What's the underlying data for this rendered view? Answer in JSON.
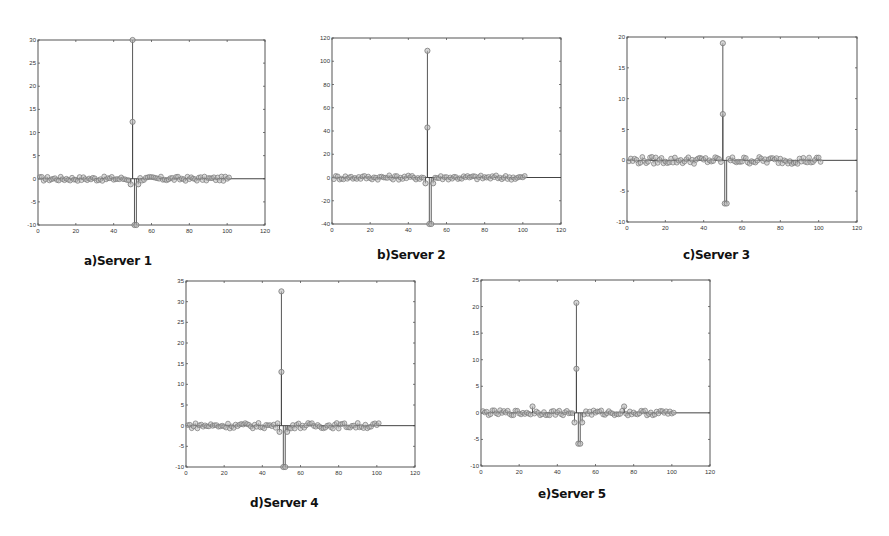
{
  "figure": {
    "panels": [
      {
        "id": "a",
        "caption": "a)Server 1"
      },
      {
        "id": "b",
        "caption": "b)Server 2"
      },
      {
        "id": "c",
        "caption": "c)Server 3"
      },
      {
        "id": "d",
        "caption": "d)Server 4"
      },
      {
        "id": "e",
        "caption": "e)Server 5"
      }
    ]
  },
  "chart_data": [
    {
      "type": "scatter",
      "style": "stem",
      "title": "a)Server 1",
      "xlabel": "",
      "ylabel": "",
      "xlim": [
        0,
        120
      ],
      "ylim": [
        -10,
        30
      ],
      "xticks": [
        0,
        20,
        40,
        60,
        80,
        100,
        120
      ],
      "yticks": [
        -10,
        -5,
        0,
        5,
        10,
        15,
        20,
        25,
        30
      ],
      "baseline": 0,
      "n_points": 101,
      "noise_amplitude": 0.5,
      "spikes": [
        {
          "x": 50,
          "y": 30
        },
        {
          "x": 50,
          "y": 12.3
        },
        {
          "x": 51,
          "y": -10
        },
        {
          "x": 52,
          "y": -10
        },
        {
          "x": 49,
          "y": -1.2
        },
        {
          "x": 53,
          "y": -1.2
        }
      ],
      "grid": false,
      "legend": null,
      "frame": {
        "left": 38,
        "top": 40,
        "right": 265,
        "bottom": 225
      }
    },
    {
      "type": "scatter",
      "style": "stem",
      "title": "b)Server 2",
      "xlabel": "",
      "ylabel": "",
      "xlim": [
        0,
        120
      ],
      "ylim": [
        -40,
        120
      ],
      "xticks": [
        0,
        20,
        40,
        60,
        80,
        100,
        120
      ],
      "yticks": [
        -40,
        -20,
        0,
        20,
        40,
        60,
        80,
        100,
        120
      ],
      "baseline": 0,
      "n_points": 101,
      "noise_amplitude": 2,
      "spikes": [
        {
          "x": 50,
          "y": 109
        },
        {
          "x": 50,
          "y": 43
        },
        {
          "x": 51,
          "y": -40
        },
        {
          "x": 52,
          "y": -40
        },
        {
          "x": 49,
          "y": -5
        },
        {
          "x": 53,
          "y": -5
        }
      ],
      "grid": false,
      "legend": null,
      "frame": {
        "left": 332,
        "top": 38,
        "right": 561,
        "bottom": 224
      }
    },
    {
      "type": "scatter",
      "style": "stem",
      "title": "c)Server 3",
      "xlabel": "",
      "ylabel": "",
      "xlim": [
        0,
        120
      ],
      "ylim": [
        -10,
        20
      ],
      "xticks": [
        0,
        20,
        40,
        60,
        80,
        100,
        120
      ],
      "yticks": [
        -10,
        -5,
        0,
        5,
        10,
        15,
        20
      ],
      "baseline": 0,
      "n_points": 101,
      "noise_amplitude": 0.6,
      "spikes": [
        {
          "x": 50,
          "y": 19
        },
        {
          "x": 50,
          "y": 7.5
        },
        {
          "x": 51,
          "y": -7
        },
        {
          "x": 52,
          "y": -7
        }
      ],
      "grid": false,
      "legend": null,
      "frame": {
        "left": 627,
        "top": 37,
        "right": 857,
        "bottom": 222
      }
    },
    {
      "type": "scatter",
      "style": "stem",
      "title": "d)Server 4",
      "xlabel": "",
      "ylabel": "",
      "xlim": [
        0,
        120
      ],
      "ylim": [
        -10,
        35
      ],
      "xticks": [
        0,
        20,
        40,
        60,
        80,
        100,
        120
      ],
      "yticks": [
        -10,
        -5,
        0,
        5,
        10,
        15,
        20,
        25,
        30,
        35
      ],
      "baseline": 0,
      "n_points": 101,
      "noise_amplitude": 0.7,
      "spikes": [
        {
          "x": 50,
          "y": 32.5
        },
        {
          "x": 50,
          "y": 13
        },
        {
          "x": 51,
          "y": -10
        },
        {
          "x": 52,
          "y": -10
        },
        {
          "x": 49,
          "y": -1.5
        },
        {
          "x": 53,
          "y": -1.5
        }
      ],
      "grid": false,
      "legend": null,
      "frame": {
        "left": 186,
        "top": 281,
        "right": 415,
        "bottom": 467
      }
    },
    {
      "type": "scatter",
      "style": "stem",
      "title": "e)Server 5",
      "xlabel": "",
      "ylabel": "",
      "xlim": [
        0,
        120
      ],
      "ylim": [
        -10,
        25
      ],
      "xticks": [
        0,
        20,
        40,
        60,
        80,
        100,
        120
      ],
      "yticks": [
        -10,
        -5,
        0,
        5,
        10,
        15,
        20,
        25
      ],
      "baseline": 0,
      "n_points": 101,
      "noise_amplitude": 0.5,
      "spikes": [
        {
          "x": 50,
          "y": 20.7
        },
        {
          "x": 50,
          "y": 8.3
        },
        {
          "x": 51,
          "y": -5.8
        },
        {
          "x": 52,
          "y": -5.8
        },
        {
          "x": 49,
          "y": -1.8
        },
        {
          "x": 53,
          "y": -1.8
        },
        {
          "x": 27,
          "y": 1.2
        },
        {
          "x": 75,
          "y": 1.2
        }
      ],
      "grid": false,
      "legend": null,
      "frame": {
        "left": 481,
        "top": 280,
        "right": 710,
        "bottom": 466
      }
    }
  ],
  "colors": {
    "axis": "#555555",
    "stem": "#444444",
    "marker": "#777777",
    "marker_fill": "#bbbbbb",
    "caption": "#111111"
  }
}
